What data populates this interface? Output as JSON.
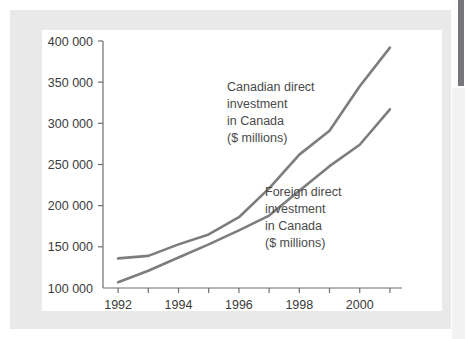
{
  "chart_data": {
    "type": "line",
    "title": "",
    "xlabel": "",
    "ylabel": "",
    "xlim": [
      1991.5,
      2001.4
    ],
    "ylim": [
      100000,
      400000
    ],
    "grid": false,
    "legend_position": "inline-annotations",
    "x": [
      1992,
      1993,
      1994,
      1995,
      1996,
      1997,
      1998,
      1999,
      2000,
      2001
    ],
    "x_tick_values": [
      1992,
      1993,
      1994,
      1995,
      1996,
      1997,
      1998,
      1999,
      2000,
      2001
    ],
    "x_tick_labels": [
      "1992",
      "",
      "1994",
      "",
      "1996",
      "",
      "1998",
      "",
      "2000",
      ""
    ],
    "y_tick_values": [
      100000,
      150000,
      200000,
      250000,
      300000,
      350000,
      400000
    ],
    "y_tick_labels": [
      "100 000",
      "150 000",
      "200 000",
      "250 000",
      "300 000",
      "350 000",
      "400 000"
    ],
    "series": [
      {
        "name": "Canadian direct investment in Canada ($ millions)",
        "annotation": [
          "Canadian direct",
          "investment",
          "in Canada",
          "($ millions)"
        ],
        "color": "#7d7d7d",
        "values": [
          107000,
          121000,
          137000,
          153000,
          170000,
          188000,
          218000,
          248000,
          274000,
          317000
        ]
      },
      {
        "name": "Foreign direct investment in Canada ($ millions)",
        "annotation": [
          "Foreign direct",
          "investment",
          "in Canada",
          "($ millions)"
        ],
        "color": "#7d7d7d",
        "values": [
          136000,
          139000,
          153000,
          165000,
          186000,
          221000,
          262000,
          291000,
          345000,
          392000
        ]
      }
    ]
  },
  "figure": {
    "frame_color": "#e9e9e9",
    "panel_color": "#ffffff",
    "axis_color": "#6f6f6f",
    "line_color": "#7d7d7d",
    "text_color": "#3b3b3b"
  }
}
